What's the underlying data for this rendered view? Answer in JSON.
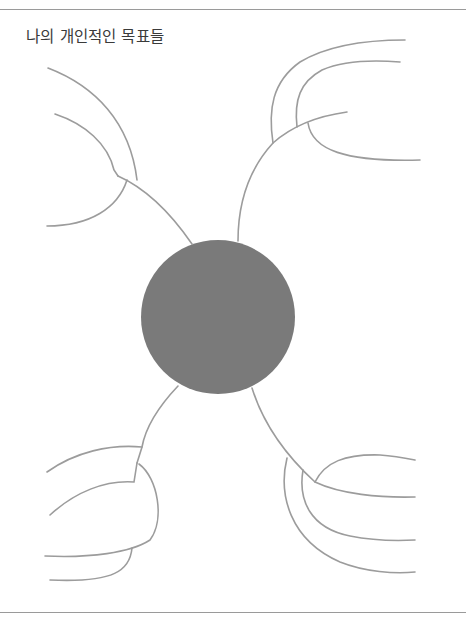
{
  "title": "나의 개인적인 목표들",
  "diagram": {
    "type": "mind-map",
    "center": {
      "label": "",
      "fill": "#7a7a7a",
      "cx": 218,
      "cy": 317,
      "r": 77
    },
    "line_color": "#9c9c9c",
    "branches": [
      {
        "position": "top-left",
        "bubble_count": 2,
        "label": ""
      },
      {
        "position": "top-right",
        "bubble_count": 2,
        "label": ""
      },
      {
        "position": "bottom-left",
        "bubble_count": 3,
        "label": ""
      },
      {
        "position": "bottom-right",
        "bubble_count": 3,
        "label": ""
      }
    ]
  }
}
